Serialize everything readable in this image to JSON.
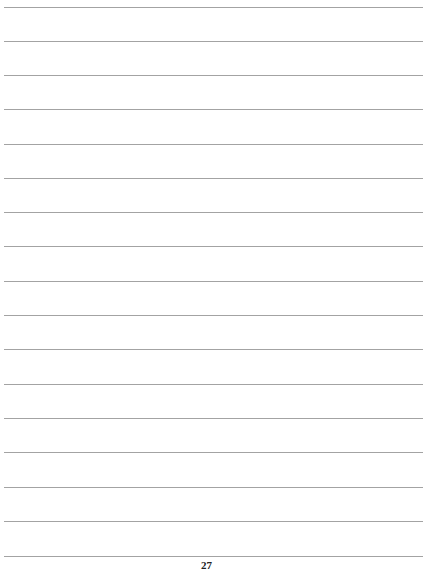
{
  "page": {
    "type": "lined-notes-page",
    "line_count": 17,
    "line_color": "#a3a3a3",
    "line_positions_y": [
      7,
      41,
      75,
      109,
      144,
      178,
      212,
      246,
      281,
      315,
      349,
      384,
      418,
      452,
      487,
      521,
      556
    ],
    "page_number": "27"
  }
}
